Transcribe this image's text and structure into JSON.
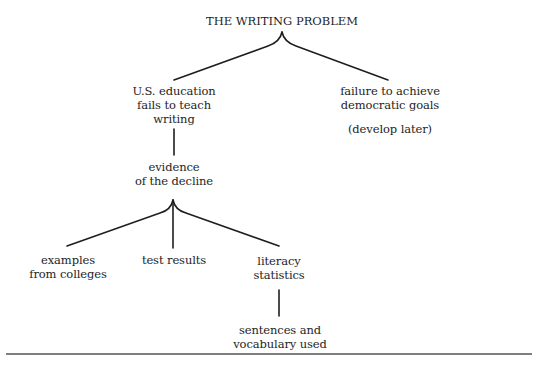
{
  "diagram": {
    "title": "THE WRITING PROBLEM",
    "level1": {
      "left": {
        "lines": [
          "U.S. education",
          "fails to teach",
          "writing"
        ]
      },
      "right": {
        "lines": [
          "failure to achieve",
          "democratic goals"
        ],
        "note": "(develop later)"
      }
    },
    "level2": {
      "lines": [
        "evidence",
        "of the decline"
      ]
    },
    "level3": {
      "left": {
        "lines": [
          "examples",
          "from colleges"
        ]
      },
      "middle": {
        "lines": [
          "test results"
        ]
      },
      "right": {
        "lines": [
          "literacy",
          "statistics"
        ]
      }
    },
    "level4": {
      "lines": [
        "sentences and",
        "vocabulary used"
      ]
    },
    "colors": {
      "ink": "#1e1e1e",
      "rule": "#555555",
      "background": "#ffffff"
    }
  }
}
